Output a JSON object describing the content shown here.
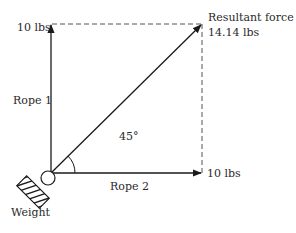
{
  "diagram": {
    "type": "force-vector-diagram",
    "labels": {
      "rope1": "Rope 1",
      "rope2": "Rope 2",
      "rope1_force": "10 lbs",
      "rope2_force": "10 lbs",
      "resultant_title": "Resultant force",
      "resultant_value": "14.14 lbs",
      "angle": "45°",
      "weight": "Weight"
    },
    "colors": {
      "line": "#1a1a1a",
      "dashed": "#555555",
      "text": "#2a2a2a"
    }
  }
}
